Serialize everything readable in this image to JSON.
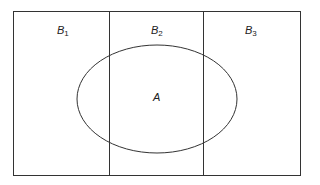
{
  "diagram": {
    "type": "partition-venn",
    "partitions": [
      {
        "label": "B",
        "subscript": "1"
      },
      {
        "label": "B",
        "subscript": "2"
      },
      {
        "label": "B",
        "subscript": "3"
      }
    ],
    "event": {
      "label": "A"
    },
    "colors": {
      "stroke": "#333333",
      "background": "#ffffff"
    }
  }
}
